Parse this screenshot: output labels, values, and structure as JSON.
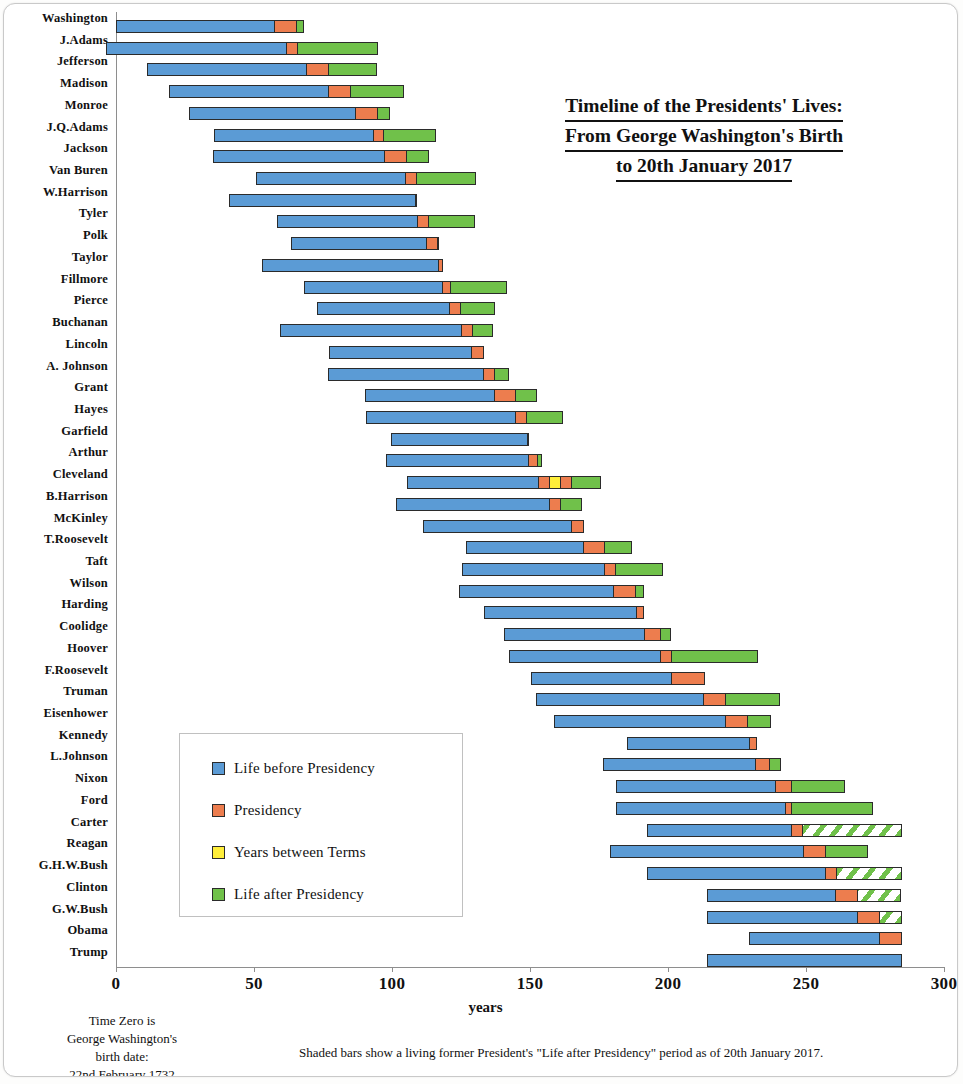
{
  "chart_data": {
    "type": "bar",
    "subtype": "stacked-horizontal-timeline",
    "title": [
      "Timeline of the Presidents' Lives:",
      "From George Washington's Birth",
      "to 20th January 2017"
    ],
    "xlabel": "years",
    "ylabel": "",
    "xlim": [
      0,
      300
    ],
    "xticks": [
      0,
      50,
      100,
      150,
      200,
      250,
      300
    ],
    "grid": false,
    "legend_position": "inside-left-lower",
    "series": [
      {
        "name": "Life before Presidency",
        "key": "before",
        "color": "#5b9bd5"
      },
      {
        "name": "Presidency",
        "key": "term",
        "color": "#ed7d4e"
      },
      {
        "name": "Years between Terms",
        "key": "between",
        "color": "#ffee3a"
      },
      {
        "name": "Life after Presidency",
        "key": "after",
        "color": "#70c14a"
      }
    ],
    "categories": [
      "Washington",
      "J.Adams",
      "Jefferson",
      "Madison",
      "Monroe",
      "J.Q.Adams",
      "Jackson",
      "Van Buren",
      "W.Harrison",
      "Tyler",
      "Polk",
      "Taylor",
      "Fillmore",
      "Pierce",
      "Buchanan",
      "Lincoln",
      "A. Johnson",
      "Grant",
      "Hayes",
      "Garfield",
      "Arthur",
      "Cleveland",
      "B.Harrison",
      "McKinley",
      "T.Roosevelt",
      "Taft",
      "Wilson",
      "Harding",
      "Coolidge",
      "Hoover",
      "F.Roosevelt",
      "Truman",
      "Eisenhower",
      "Kennedy",
      "L.Johnson",
      "Nixon",
      "Ford",
      "Carter",
      "Reagan",
      "G.H.W.Bush",
      "Clinton",
      "G.W.Bush",
      "Obama",
      "Trump"
    ],
    "rows": [
      {
        "label": "Washington",
        "start": 0.0,
        "segments": [
          {
            "key": "before",
            "value": 57.4
          },
          {
            "key": "term",
            "value": 8.0
          },
          {
            "key": "after",
            "value": 2.8
          }
        ]
      },
      {
        "label": "J.Adams",
        "start": -3.5,
        "segments": [
          {
            "key": "before",
            "value": 65.2
          },
          {
            "key": "term",
            "value": 4.0
          },
          {
            "key": "after",
            "value": 29.2
          }
        ]
      },
      {
        "label": "Jefferson",
        "start": 11.2,
        "segments": [
          {
            "key": "before",
            "value": 57.8
          },
          {
            "key": "term",
            "value": 8.0
          },
          {
            "key": "after",
            "value": 17.4
          }
        ]
      },
      {
        "label": "Madison",
        "start": 19.3,
        "segments": [
          {
            "key": "before",
            "value": 57.8
          },
          {
            "key": "term",
            "value": 8.0
          },
          {
            "key": "after",
            "value": 19.4
          }
        ]
      },
      {
        "label": "Monroe",
        "start": 26.3,
        "segments": [
          {
            "key": "before",
            "value": 60.7
          },
          {
            "key": "term",
            "value": 8.0
          },
          {
            "key": "after",
            "value": 4.2
          }
        ]
      },
      {
        "label": "J.Q.Adams",
        "start": 35.5,
        "segments": [
          {
            "key": "before",
            "value": 57.6
          },
          {
            "key": "term",
            "value": 4.0
          },
          {
            "key": "after",
            "value": 18.9
          }
        ]
      },
      {
        "label": "Jackson",
        "start": 35.3,
        "segments": [
          {
            "key": "before",
            "value": 61.9
          },
          {
            "key": "term",
            "value": 8.0
          },
          {
            "key": "after",
            "value": 8.3
          }
        ]
      },
      {
        "label": "Van Buren",
        "start": 50.6,
        "segments": [
          {
            "key": "before",
            "value": 54.3
          },
          {
            "key": "term",
            "value": 4.0
          },
          {
            "key": "after",
            "value": 21.7
          }
        ]
      },
      {
        "label": "W.Harrison",
        "start": 41.0,
        "segments": [
          {
            "key": "before",
            "value": 68.1
          },
          {
            "key": "term",
            "value": 0.1
          }
        ]
      },
      {
        "label": "Tyler",
        "start": 58.2,
        "segments": [
          {
            "key": "before",
            "value": 51.0
          },
          {
            "key": "term",
            "value": 3.9
          },
          {
            "key": "after",
            "value": 16.9
          }
        ]
      },
      {
        "label": "Polk",
        "start": 63.3,
        "segments": [
          {
            "key": "before",
            "value": 49.3
          },
          {
            "key": "term",
            "value": 4.0
          },
          {
            "key": "after",
            "value": 0.3
          }
        ]
      },
      {
        "label": "Taylor",
        "start": 52.8,
        "segments": [
          {
            "key": "before",
            "value": 64.4
          },
          {
            "key": "term",
            "value": 1.3
          }
        ]
      },
      {
        "label": "Fillmore",
        "start": 68.0,
        "segments": [
          {
            "key": "before",
            "value": 50.3
          },
          {
            "key": "term",
            "value": 2.7
          },
          {
            "key": "after",
            "value": 20.5
          }
        ]
      },
      {
        "label": "Pierce",
        "start": 72.7,
        "segments": [
          {
            "key": "before",
            "value": 48.2
          },
          {
            "key": "term",
            "value": 4.0
          },
          {
            "key": "after",
            "value": 12.6
          }
        ]
      },
      {
        "label": "Buchanan",
        "start": 59.3,
        "segments": [
          {
            "key": "before",
            "value": 65.9
          },
          {
            "key": "term",
            "value": 4.0
          },
          {
            "key": "after",
            "value": 7.3
          }
        ]
      },
      {
        "label": "Lincoln",
        "start": 77.0,
        "segments": [
          {
            "key": "before",
            "value": 52.1
          },
          {
            "key": "term",
            "value": 4.1
          }
        ]
      },
      {
        "label": "A. Johnson",
        "start": 76.8,
        "segments": [
          {
            "key": "before",
            "value": 56.4
          },
          {
            "key": "term",
            "value": 3.9
          },
          {
            "key": "after",
            "value": 5.2
          }
        ]
      },
      {
        "label": "Grant",
        "start": 90.2,
        "segments": [
          {
            "key": "before",
            "value": 46.8
          },
          {
            "key": "term",
            "value": 8.0
          },
          {
            "key": "after",
            "value": 7.6
          }
        ]
      },
      {
        "label": "Hayes",
        "start": 90.7,
        "segments": [
          {
            "key": "before",
            "value": 54.2
          },
          {
            "key": "term",
            "value": 4.0
          },
          {
            "key": "after",
            "value": 13.1
          }
        ]
      },
      {
        "label": "Garfield",
        "start": 99.8,
        "segments": [
          {
            "key": "before",
            "value": 49.4
          },
          {
            "key": "term",
            "value": 0.5
          }
        ]
      },
      {
        "label": "Arthur",
        "start": 97.7,
        "segments": [
          {
            "key": "before",
            "value": 51.8
          },
          {
            "key": "term",
            "value": 3.5
          },
          {
            "key": "after",
            "value": 1.4
          }
        ]
      },
      {
        "label": "Cleveland",
        "start": 105.3,
        "segments": [
          {
            "key": "before",
            "value": 47.8
          },
          {
            "key": "term",
            "value": 4.0
          },
          {
            "key": "between",
            "value": 4.0
          },
          {
            "key": "term",
            "value": 4.0
          },
          {
            "key": "after",
            "value": 10.5
          }
        ]
      },
      {
        "label": "B.Harrison",
        "start": 101.6,
        "segments": [
          {
            "key": "before",
            "value": 55.4
          },
          {
            "key": "term",
            "value": 4.0
          },
          {
            "key": "after",
            "value": 7.9
          }
        ]
      },
      {
        "label": "McKinley",
        "start": 111.1,
        "segments": [
          {
            "key": "before",
            "value": 54.1
          },
          {
            "key": "term",
            "value": 4.5
          }
        ]
      },
      {
        "label": "T.Roosevelt",
        "start": 126.7,
        "segments": [
          {
            "key": "before",
            "value": 42.8
          },
          {
            "key": "term",
            "value": 7.4
          },
          {
            "key": "after",
            "value": 10.2
          }
        ]
      },
      {
        "label": "Taft",
        "start": 125.4,
        "segments": [
          {
            "key": "before",
            "value": 51.5
          },
          {
            "key": "term",
            "value": 4.0
          },
          {
            "key": "after",
            "value": 17.4
          }
        ]
      },
      {
        "label": "Wilson",
        "start": 124.3,
        "segments": [
          {
            "key": "before",
            "value": 56.1
          },
          {
            "key": "term",
            "value": 8.0
          },
          {
            "key": "after",
            "value": 2.9
          }
        ]
      },
      {
        "label": "Harding",
        "start": 133.5,
        "segments": [
          {
            "key": "before",
            "value": 55.4
          },
          {
            "key": "term",
            "value": 2.4
          }
        ]
      },
      {
        "label": "Coolidge",
        "start": 140.5,
        "segments": [
          {
            "key": "before",
            "value": 51.2
          },
          {
            "key": "term",
            "value": 5.6
          },
          {
            "key": "after",
            "value": 3.7
          }
        ]
      },
      {
        "label": "Hoover",
        "start": 142.5,
        "segments": [
          {
            "key": "before",
            "value": 54.6
          },
          {
            "key": "term",
            "value": 4.0
          },
          {
            "key": "after",
            "value": 31.5
          }
        ]
      },
      {
        "label": "F.Roosevelt",
        "start": 150.2,
        "segments": [
          {
            "key": "before",
            "value": 51.1
          },
          {
            "key": "term",
            "value": 12.1
          }
        ]
      },
      {
        "label": "Truman",
        "start": 152.3,
        "segments": [
          {
            "key": "before",
            "value": 60.7
          },
          {
            "key": "term",
            "value": 7.8
          },
          {
            "key": "after",
            "value": 19.9
          }
        ]
      },
      {
        "label": "Eisenhower",
        "start": 158.7,
        "segments": [
          {
            "key": "before",
            "value": 62.3
          },
          {
            "key": "term",
            "value": 8.0
          },
          {
            "key": "after",
            "value": 8.2
          }
        ]
      },
      {
        "label": "Kennedy",
        "start": 185.3,
        "segments": [
          {
            "key": "before",
            "value": 44.2
          },
          {
            "key": "term",
            "value": 2.8
          }
        ]
      },
      {
        "label": "L.Johnson",
        "start": 176.6,
        "segments": [
          {
            "key": "before",
            "value": 55.2
          },
          {
            "key": "term",
            "value": 5.2
          },
          {
            "key": "after",
            "value": 4.1
          }
        ]
      },
      {
        "label": "Nixon",
        "start": 181.0,
        "segments": [
          {
            "key": "before",
            "value": 58.0
          },
          {
            "key": "term",
            "value": 5.6
          },
          {
            "key": "after",
            "value": 19.7
          }
        ]
      },
      {
        "label": "Ford",
        "start": 181.3,
        "segments": [
          {
            "key": "before",
            "value": 61.1
          },
          {
            "key": "term",
            "value": 2.4
          },
          {
            "key": "after",
            "value": 29.6
          }
        ]
      },
      {
        "label": "Carter",
        "start": 192.5,
        "segments": [
          {
            "key": "before",
            "value": 52.2
          },
          {
            "key": "term",
            "value": 4.0
          },
          {
            "key": "after",
            "value": 36.0,
            "live": true
          }
        ]
      },
      {
        "label": "Reagan",
        "start": 179.1,
        "segments": [
          {
            "key": "before",
            "value": 69.9
          },
          {
            "key": "term",
            "value": 8.0
          },
          {
            "key": "after",
            "value": 15.6
          }
        ]
      },
      {
        "label": "G.H.W.Bush",
        "start": 192.4,
        "segments": [
          {
            "key": "before",
            "value": 64.5
          },
          {
            "key": "term",
            "value": 4.0
          },
          {
            "key": "after",
            "value": 24.0,
            "live": true
          }
        ]
      },
      {
        "label": "Clinton",
        "start": 214.3,
        "segments": [
          {
            "key": "before",
            "value": 46.3
          },
          {
            "key": "term",
            "value": 8.0
          },
          {
            "key": "after",
            "value": 16.0,
            "live": true
          }
        ]
      },
      {
        "label": "G.W.Bush",
        "start": 214.3,
        "segments": [
          {
            "key": "before",
            "value": 54.5
          },
          {
            "key": "term",
            "value": 8.0
          },
          {
            "key": "after",
            "value": 8.0,
            "live": true
          }
        ]
      },
      {
        "label": "Obama",
        "start": 229.3,
        "segments": [
          {
            "key": "before",
            "value": 47.4
          },
          {
            "key": "term",
            "value": 8.0
          }
        ]
      },
      {
        "label": "Trump",
        "start": 214.3,
        "segments": [
          {
            "key": "before",
            "value": 70.6
          }
        ]
      }
    ]
  },
  "legend": {
    "items": [
      {
        "label": "Life before Presidency",
        "color": "#5b9bd5",
        "key": "before"
      },
      {
        "label": "Presidency",
        "color": "#ed7d4e",
        "key": "term"
      },
      {
        "label": "Years between Terms",
        "color": "#ffee3a",
        "key": "between"
      },
      {
        "label": "Life after Presidency",
        "color": "#70c14a",
        "key": "after"
      }
    ]
  },
  "notes": {
    "left": "Time Zero is George Washington's birth date: 22nd February 1732",
    "left_lines": [
      "Time Zero is",
      "George Washington's",
      "birth date:",
      "22nd February 1732"
    ],
    "right": "Shaded bars show a living former President's \"Life after Presidency\" period as of 20th January 2017."
  }
}
